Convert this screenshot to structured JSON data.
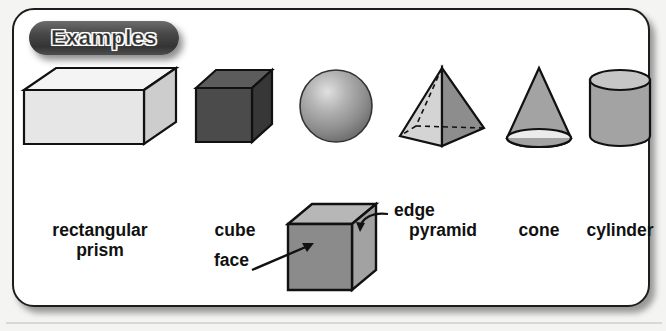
{
  "panel": {
    "header_label": "Examples",
    "border_color": "#1d1d1d",
    "background_color": "#ffffff",
    "pill_color": "#3a3a3a"
  },
  "shapes": [
    {
      "name": "rectangular-prism",
      "label": "rectangular\nprism",
      "fill": "#e2e2e2",
      "top_fill": "#f2f2f2",
      "side_fill": "#cfcfcf"
    },
    {
      "name": "cube",
      "label": "cube",
      "fill": "#4c4c4c",
      "top_fill": "#5e5e5e",
      "side_fill": "#3a3a3a"
    },
    {
      "name": "sphere",
      "label": "sphere",
      "fill": "#8e8e8e",
      "highlight": "#d6d6d6"
    },
    {
      "name": "pyramid",
      "label": "pyramid",
      "fill": "#d2d2d2",
      "side_fill": "#8a8a8a"
    },
    {
      "name": "cone",
      "label": "cone",
      "fill": "#a0a0a0",
      "base_fill": "#eaeaea"
    },
    {
      "name": "cylinder",
      "label": "cylinder",
      "fill": "#a0a0a0",
      "top_fill": "#c9c9c9"
    }
  ],
  "annotated_cube": {
    "front_fill": "#8a8a8a",
    "top_fill": "#b5b5b5",
    "side_fill": "#9f9f9f",
    "callouts": [
      {
        "name": "edge",
        "label": "edge"
      },
      {
        "name": "face",
        "label": "face"
      }
    ]
  }
}
